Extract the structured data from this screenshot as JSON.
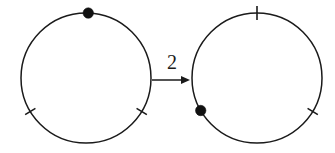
{
  "figure": {
    "title": "",
    "background_color": "#ffffff",
    "ink_color": "#1a1a1a",
    "width": 335,
    "height": 153
  },
  "arrow": {
    "label": "2",
    "name": "transformation-arrow",
    "x1": 152,
    "y1": 80,
    "x2": 190,
    "y2": 80,
    "label_x": 172,
    "label_y": 69,
    "head_length": 9,
    "head_width": 8
  },
  "diagrams": [
    {
      "id": "left-circle-diagram",
      "label": "source-circle",
      "circle": {
        "cx": 86,
        "cy": 78,
        "r": 65
      },
      "points": [
        {
          "name": "filled-point-top",
          "kind": "filled-dot",
          "angle_deg": -88,
          "radius": 5.2
        }
      ],
      "ticks": [
        {
          "name": "tick-lower-left",
          "angle_deg": 149,
          "inner": 6,
          "outer": 6
        },
        {
          "name": "tick-lower-right",
          "angle_deg": 31,
          "inner": 6,
          "outer": 6
        }
      ]
    },
    {
      "id": "right-circle-diagram",
      "label": "result-circle",
      "circle": {
        "cx": 257,
        "cy": 78,
        "r": 65
      },
      "points": [
        {
          "name": "filled-point-lower-left",
          "kind": "filled-dot",
          "angle_deg": 150,
          "radius": 5.2
        }
      ],
      "ticks": [
        {
          "name": "tick-top",
          "angle_deg": -90,
          "inner": 7,
          "outer": 7
        },
        {
          "name": "tick-lower-right",
          "angle_deg": 31,
          "inner": 6,
          "outer": 6
        }
      ]
    }
  ]
}
